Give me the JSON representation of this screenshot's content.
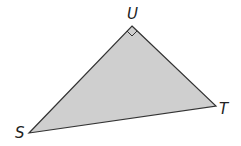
{
  "diagram": {
    "type": "right-triangle",
    "fill_color": "#cfcfcf",
    "stroke_color": "#333333",
    "vertices": [
      {
        "name": "U",
        "x": 132,
        "y": 26,
        "label_x": 127,
        "label_y": 19
      },
      {
        "name": "S",
        "x": 29,
        "y": 133,
        "label_x": 15,
        "label_y": 138
      },
      {
        "name": "T",
        "x": 216,
        "y": 106,
        "label_x": 219,
        "label_y": 114
      }
    ],
    "right_angle_at": "U",
    "labels": {
      "u": "U",
      "s": "S",
      "t": "T"
    }
  }
}
